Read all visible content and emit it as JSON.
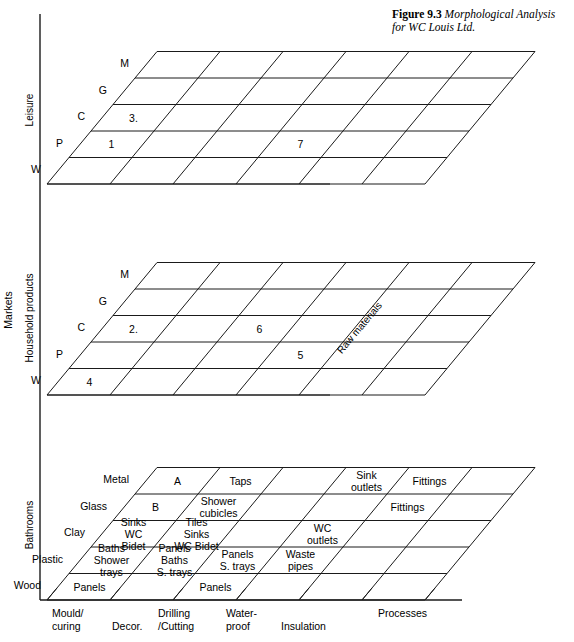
{
  "figure": {
    "label": "Figure",
    "number": "9.3",
    "title": "Morphological Analysis for WC Louis Ltd."
  },
  "axes": {
    "y_outer_label": "Markets",
    "x_axis_label": "Processes",
    "depth_axis_label": "Raw materials",
    "x_ticks": [
      "Mould/\ncuring",
      "Decor.",
      "Drilling\n/Cutting",
      "Water-\nproof",
      "Insulation"
    ],
    "x_ticks_flat": [
      "Mould/",
      "curing",
      "Decor.",
      "Drilling",
      "/Cutting",
      "Water-",
      "proof",
      "Insulation"
    ]
  },
  "panels": [
    {
      "name": "leisure",
      "y_label": "Leisure",
      "depth_labels": [
        "W",
        "P",
        "C",
        "G",
        "M"
      ],
      "rows": 5,
      "cols": 6,
      "cells": [
        {
          "row": 1,
          "col": 0,
          "text": "1"
        },
        {
          "row": 2,
          "col": 0,
          "text": "3."
        },
        {
          "row": 1,
          "col": 3,
          "text": "7"
        }
      ]
    },
    {
      "name": "household-products",
      "y_label": "Household products",
      "depth_labels": [
        "W",
        "P",
        "C",
        "G",
        "M"
      ],
      "rows": 5,
      "cols": 6,
      "depth_axis_label": "Raw materials",
      "cells": [
        {
          "row": 0,
          "col": 0,
          "text": "4"
        },
        {
          "row": 2,
          "col": 0,
          "text": "2."
        },
        {
          "row": 2,
          "col": 2,
          "text": "6"
        },
        {
          "row": 1,
          "col": 3,
          "text": "5"
        }
      ]
    },
    {
      "name": "bathrooms",
      "y_label": "Bathrooms",
      "depth_labels": [
        "Wood",
        "Plastic",
        "Clay",
        "Glass",
        "Metal"
      ],
      "rows": 5,
      "cols": 6,
      "cells": [
        {
          "row": 0,
          "col": 0,
          "lines": [
            "Panels"
          ]
        },
        {
          "row": 0,
          "col": 2,
          "lines": [
            "Panels"
          ]
        },
        {
          "row": 1,
          "col": 0,
          "lines": [
            "Baths",
            "Shower",
            "trays"
          ]
        },
        {
          "row": 1,
          "col": 1,
          "lines": [
            "Panels",
            "Baths",
            "S. trays"
          ]
        },
        {
          "row": 1,
          "col": 2,
          "lines": [
            "Panels",
            "S. trays"
          ]
        },
        {
          "row": 1,
          "col": 3,
          "lines": [
            "Waste",
            "pipes"
          ]
        },
        {
          "row": 2,
          "col": 0,
          "lines": [
            "Sinks",
            "WC",
            "Bidet"
          ]
        },
        {
          "row": 2,
          "col": 1,
          "lines": [
            "Tiles",
            "Sinks",
            "WC Bidet"
          ]
        },
        {
          "row": 2,
          "col": 3,
          "lines": [
            "WC",
            "outlets"
          ]
        },
        {
          "row": 3,
          "col": 0,
          "lines": [
            "B"
          ]
        },
        {
          "row": 3,
          "col": 1,
          "lines": [
            "Shower",
            "cubicles"
          ]
        },
        {
          "row": 3,
          "col": 4,
          "lines": [
            "Fittings"
          ]
        },
        {
          "row": 4,
          "col": 0,
          "lines": [
            "A"
          ]
        },
        {
          "row": 4,
          "col": 1,
          "lines": [
            "Taps"
          ]
        },
        {
          "row": 4,
          "col": 3,
          "lines": [
            "Sink",
            "outlets"
          ]
        },
        {
          "row": 4,
          "col": 4,
          "lines": [
            "Fittings"
          ]
        }
      ]
    }
  ],
  "colors": {
    "line": "#1a1a1a",
    "background": "#ffffff",
    "text": "#000000"
  }
}
